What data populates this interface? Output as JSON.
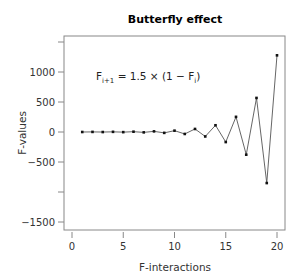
{
  "chart_data": {
    "type": "line",
    "title": "Butterfly effect",
    "xlabel": "F-interactions",
    "ylabel": "F-values",
    "annotation": "F_{i+1} = 1.5 × (1 − F_i)",
    "annotation_parts": {
      "lhs": "F",
      "lhs_sub": "i+1",
      "mid": " = 1.5 × (1 − F",
      "rhs_sub": "i",
      "end": ")"
    },
    "xlim": [
      0,
      20
    ],
    "ylim": [
      -1500,
      1500
    ],
    "x_ticks": [
      0,
      5,
      10,
      15,
      20
    ],
    "x_tick_labels": [
      "0",
      "5",
      "10",
      "15",
      "20"
    ],
    "y_ticks": [
      -1500,
      -1000,
      -500,
      0,
      500,
      1000,
      1500
    ],
    "y_tick_labels": [
      "−1500",
      "",
      "−500",
      "0",
      "500",
      "1000",
      ""
    ],
    "grid": false,
    "legend": "none",
    "x": [
      1,
      2,
      3,
      4,
      5,
      6,
      7,
      8,
      9,
      10,
      11,
      12,
      13,
      14,
      15,
      16,
      17,
      18,
      19,
      20
    ],
    "values": [
      0,
      1.5,
      -0.7,
      2.6,
      -2.3,
      5,
      -6,
      10.6,
      -14.4,
      22.2,
      -32.7,
      50.6,
      -74.4,
      112.2,
      -167.7,
      252.5,
      -378.1,
      567.7,
      -851,
      1278
    ]
  },
  "colors": {
    "line": "#555555",
    "marker": "#111111",
    "axis": "#888888"
  }
}
